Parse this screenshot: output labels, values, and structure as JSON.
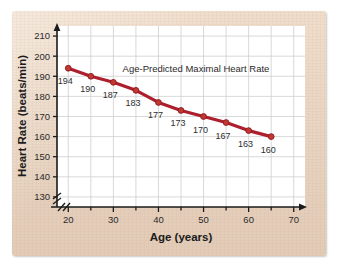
{
  "figure": {
    "panel_background_color": "#e9d5c2",
    "plot_background_color": "#ffffff",
    "grid_color": "#cfcfcf",
    "axis_color": "#1b1b1b",
    "series_color": "#ad1f2d"
  },
  "chart_data": {
    "type": "line",
    "title": "Age-Predicted Maximal Heart Rate",
    "xlabel": "Age (years)",
    "ylabel": "Heart Rate (beats/min)",
    "x": [
      20,
      25,
      30,
      35,
      40,
      45,
      50,
      55,
      60,
      65
    ],
    "values": [
      194,
      190,
      187,
      183,
      177,
      173,
      170,
      167,
      163,
      160
    ],
    "point_labels": [
      "194",
      "190",
      "187",
      "183",
      "177",
      "173",
      "170",
      "167",
      "163",
      "160"
    ],
    "xlim": [
      17.5,
      72.5
    ],
    "ylim": [
      125,
      215
    ],
    "x_major_ticks": [
      20,
      30,
      40,
      50,
      60,
      70
    ],
    "x_major_tick_labels": [
      "20",
      "30",
      "40",
      "50",
      "60",
      "70"
    ],
    "x_minor_ticks": [
      25,
      35,
      45,
      55,
      65
    ],
    "y_ticks": [
      130,
      140,
      150,
      160,
      170,
      180,
      190,
      200,
      210
    ],
    "y_tick_labels": [
      "130",
      "140",
      "150",
      "160",
      "170",
      "180",
      "190",
      "200",
      "210"
    ],
    "grid": true,
    "grid_x_values": [
      20,
      25,
      30,
      35,
      40,
      45,
      50,
      55,
      60,
      65,
      70
    ],
    "grid_y_values": [
      130,
      140,
      150,
      160,
      170,
      180,
      190,
      200,
      210
    ],
    "legend": "none",
    "axis_break_x": true,
    "axis_break_y": true,
    "marker": "circle",
    "line_width": 3
  }
}
